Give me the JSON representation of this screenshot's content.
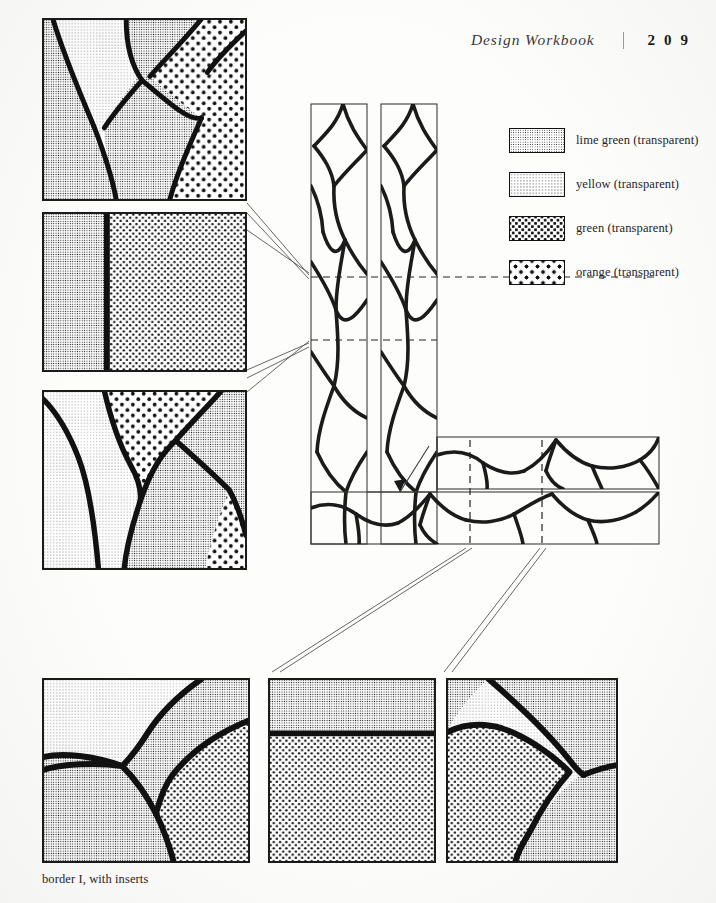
{
  "page": {
    "width": 716,
    "height": 903,
    "background_color": "#fdfdfb",
    "ink_color": "#111111"
  },
  "header": {
    "title": "Design Workbook",
    "separator": "|",
    "folio": "2 0 9"
  },
  "legend": {
    "items": [
      {
        "label": "lime green (transparent)",
        "pattern": "pat-limegreen",
        "swatch_name": "legend-swatch-lime-green"
      },
      {
        "label": "yellow (transparent)",
        "pattern": "pat-yellow",
        "swatch_name": "legend-swatch-yellow"
      },
      {
        "label": "green (transparent)",
        "pattern": "pat-green",
        "swatch_name": "legend-swatch-green"
      },
      {
        "label": "orange (transparent)",
        "pattern": "pat-orange",
        "swatch_name": "legend-swatch-orange"
      }
    ]
  },
  "caption": {
    "text": "border I, with inserts"
  },
  "figure": {
    "kind": "technical illustration",
    "detail_panels": [
      {
        "id": "insert-top-left",
        "name": "detail-panel-1",
        "x": 42,
        "y": 18,
        "width": 205,
        "height": 183,
        "description": "four glass cells divided by heavy leading lines",
        "fills": [
          "lime green (transparent)",
          "yellow (transparent)",
          "green (transparent)",
          "orange (transparent)"
        ]
      },
      {
        "id": "insert-mid-left",
        "name": "detail-panel-2",
        "x": 42,
        "y": 212,
        "width": 205,
        "height": 160,
        "description": "vertical split, single straight lead line",
        "fills": [
          "lime green (transparent)",
          "green (transparent)"
        ]
      },
      {
        "id": "insert-lower-left",
        "name": "detail-panel-3",
        "x": 42,
        "y": 390,
        "width": 205,
        "height": 180,
        "description": "branching leading with four cells",
        "fills": [
          "yellow (transparent)",
          "lime green (transparent)",
          "green (transparent)",
          "orange (transparent)"
        ]
      },
      {
        "id": "insert-bottom-1",
        "name": "detail-panel-4",
        "x": 42,
        "y": 678,
        "width": 208,
        "height": 185,
        "description": "curved leading forking to the left edge",
        "fills": [
          "yellow (transparent)",
          "lime green (transparent)",
          "green (transparent)"
        ]
      },
      {
        "id": "insert-bottom-2",
        "name": "detail-panel-5",
        "x": 268,
        "y": 678,
        "width": 168,
        "height": 185,
        "description": "horizontal split near the top",
        "fills": [
          "lime green (transparent)",
          "green (transparent)"
        ]
      },
      {
        "id": "insert-bottom-3",
        "name": "detail-panel-6",
        "x": 446,
        "y": 678,
        "width": 172,
        "height": 185,
        "description": "two arcs meeting at a node on the right",
        "fills": [
          "lime green (transparent)",
          "yellow (transparent)",
          "green (transparent)"
        ]
      }
    ],
    "border_diagram": {
      "name": "border-assembly-diagram",
      "description": "L-shaped border corner built from two vertical bands and one horizontal band of leaded glass",
      "arrow_annotation": "assembly direction arrow at inner corner",
      "callout_markers": [
        "dashed guide to vertical band upper detail",
        "dashed guide to vertical band lower detail",
        "dashed rectangle on horizontal band"
      ]
    }
  }
}
